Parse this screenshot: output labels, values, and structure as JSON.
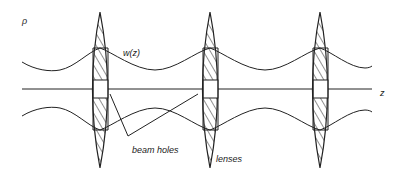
{
  "diagram": {
    "labels": {
      "rho": "ρ",
      "w": "w(z)",
      "z": "z",
      "beam_holes": "beam holes",
      "lenses": "lenses"
    },
    "colors": {
      "ink": "#222222",
      "background": "#ffffff"
    },
    "lens_count": 3
  }
}
